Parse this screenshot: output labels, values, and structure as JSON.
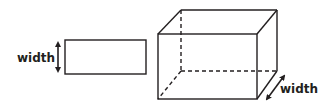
{
  "figures": {
    "rectangle": {
      "label": "width",
      "dimension_arrow": "vertical double-headed arrow indicating width"
    },
    "cube": {
      "label": "width",
      "dimension_arrow": "diagonal double-headed arrow indicating depth/width",
      "hidden_edges": "dashed"
    }
  },
  "colors": {
    "stroke": "#231f20",
    "background": "#ffffff"
  }
}
